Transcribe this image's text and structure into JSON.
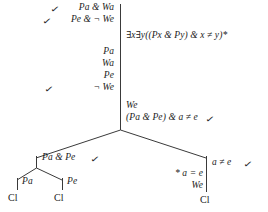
{
  "diagram": {
    "type": "truth-tree",
    "trunk": {
      "lines": [
        {
          "id": "trunk-1",
          "text": "Pa & Wa",
          "check": "✓"
        },
        {
          "id": "trunk-2",
          "text": "Pe & ¬ We",
          "check": "✓"
        },
        {
          "id": "trunk-3",
          "text": "Pa",
          "check": ""
        },
        {
          "id": "trunk-4",
          "text": "Wa",
          "check": ""
        },
        {
          "id": "trunk-5",
          "text": "Pe",
          "check": ""
        },
        {
          "id": "trunk-6",
          "text": "¬ We",
          "check": "✓"
        },
        {
          "id": "trunk-7",
          "text": "We",
          "check": ""
        },
        {
          "id": "trunk-8",
          "text": "(Pa & Pe) & a ≠ e",
          "check": "✓"
        }
      ]
    },
    "premise": {
      "id": "premise-formula",
      "text": "∃x∃y((Px & Py) & x ≠ y)*"
    },
    "left_branch": {
      "head": {
        "id": "left-head",
        "text": "Pa & Pe",
        "check": "✓"
      },
      "children": [
        {
          "id": "left-left",
          "text": "Pa",
          "closed": "Cl"
        },
        {
          "id": "left-right",
          "text": "Pe",
          "closed": "Cl"
        }
      ]
    },
    "right_branch": {
      "head": {
        "id": "right-head",
        "text": "a ≠ e",
        "check": "✓"
      },
      "lines": [
        {
          "id": "right-1",
          "text": "* a = e"
        },
        {
          "id": "right-2",
          "text": "We"
        }
      ],
      "closed": "Cl"
    },
    "colors": {
      "ink": "#1b1b1b",
      "line": "#3a3a3a",
      "background": "#ffffff"
    }
  }
}
